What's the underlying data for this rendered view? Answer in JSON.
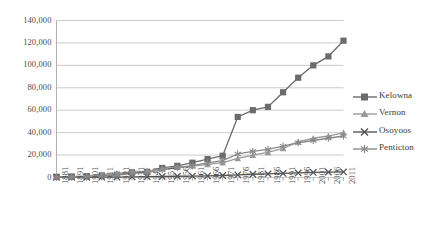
{
  "chart_data": {
    "type": "line",
    "title": "",
    "xlabel": "",
    "ylabel": "",
    "grid": true,
    "legend_position": "right",
    "ylim": [
      0,
      140000
    ],
    "yticks": [
      0,
      20000,
      40000,
      60000,
      80000,
      100000,
      120000,
      140000
    ],
    "ytick_labels": [
      "0",
      "20,000",
      "40,000",
      "60,000",
      "80,000",
      "100,000",
      "120,000",
      "140,000"
    ],
    "categories": [
      "1881",
      "1891",
      "1901",
      "1911",
      "1921",
      "1931",
      "1941",
      "1951",
      "1956",
      "1961",
      "1966",
      "1971",
      "1976",
      "1981",
      "1986",
      "1991",
      "1996",
      "2001",
      "2006",
      "2011"
    ],
    "series": [
      {
        "name": "Kelowna",
        "marker": "square",
        "color": "#6b6b6b",
        "values": [
          600,
          900,
          1200,
          1900,
          2500,
          4600,
          5100,
          8500,
          10400,
          13200,
          16400,
          19400,
          54000,
          60000,
          63000,
          76000,
          89000,
          100000,
          108000,
          122000
        ]
      },
      {
        "name": "Vernon",
        "marker": "triangle",
        "color": "#9a9a9a",
        "values": [
          400,
          700,
          900,
          2700,
          3700,
          5200,
          5700,
          7800,
          9200,
          10200,
          11700,
          13300,
          17000,
          19900,
          22400,
          26000,
          31800,
          35000,
          37000,
          40000
        ]
      },
      {
        "name": "Osoyoos",
        "marker": "cross",
        "color": "#555555",
        "values": [
          100,
          150,
          200,
          300,
          400,
          600,
          700,
          900,
          1100,
          1300,
          1500,
          1800,
          2400,
          2900,
          3200,
          3600,
          4100,
          4500,
          4800,
          5000
        ]
      },
      {
        "name": "Penticton",
        "marker": "asterisk",
        "color": "#8a8a8a",
        "values": [
          200,
          400,
          600,
          1200,
          2000,
          3700,
          4300,
          6800,
          8700,
          10500,
          13000,
          15000,
          21000,
          23200,
          25000,
          28000,
          31000,
          33000,
          35000,
          37000
        ]
      }
    ]
  },
  "legend": {
    "items": [
      {
        "label": "Kelowna"
      },
      {
        "label": "Vernon"
      },
      {
        "label": "Osoyoos"
      },
      {
        "label": "Penticton"
      }
    ]
  }
}
